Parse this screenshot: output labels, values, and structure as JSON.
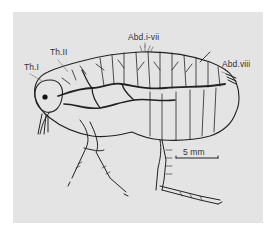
{
  "figure": {
    "background_color": "#e4e4e4",
    "line_color": "#222222",
    "labels": {
      "th1": "Th.I",
      "th2": "Th.II",
      "abd_i_vii": "Abd.i-vii",
      "abd_viii": "Abd.viii"
    },
    "scale_bar": {
      "label": "5 mm"
    }
  }
}
